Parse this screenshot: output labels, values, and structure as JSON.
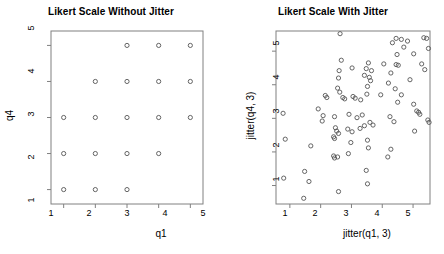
{
  "figure": {
    "width": 444,
    "height": 254,
    "background": "#ffffff",
    "foreground": "#000000",
    "point_stroke": "#555555",
    "axis_stroke": "#808080"
  },
  "panels": [
    {
      "id": "without-jitter",
      "title": "Likert Scale Without Jitter",
      "xlabel": "q1",
      "ylabel": "q4",
      "xticks": [
        "1",
        "2",
        "3",
        "4",
        "5"
      ],
      "yticks": [
        "1",
        "2",
        "3",
        "4",
        "5"
      ]
    },
    {
      "id": "with-jitter",
      "title": "Likert Scale With Jitter",
      "xlabel": "jitter(q1, 3)",
      "ylabel": "jitter(q4, 3)",
      "xticks": [
        "1",
        "2",
        "3",
        "4",
        "5"
      ],
      "yticks": [
        "1",
        "2",
        "3",
        "4",
        "5"
      ]
    }
  ],
  "chart_data": [
    {
      "type": "scatter",
      "title": "Likert Scale Without Jitter",
      "xlabel": "q1",
      "ylabel": "q4",
      "xlim": [
        0.6,
        5.4
      ],
      "ylim": [
        0.6,
        5.4
      ],
      "xticks": [
        1,
        2,
        3,
        4,
        5
      ],
      "yticks": [
        1,
        2,
        3,
        4,
        5
      ],
      "grid": false,
      "legend": null,
      "marker": "open-circle",
      "points": [
        {
          "x": 3,
          "y": 5
        },
        {
          "x": 4,
          "y": 5
        },
        {
          "x": 5,
          "y": 5
        },
        {
          "x": 2,
          "y": 4
        },
        {
          "x": 3,
          "y": 4
        },
        {
          "x": 4,
          "y": 4
        },
        {
          "x": 5,
          "y": 4
        },
        {
          "x": 1,
          "y": 3
        },
        {
          "x": 2,
          "y": 3
        },
        {
          "x": 3,
          "y": 3
        },
        {
          "x": 4,
          "y": 3
        },
        {
          "x": 5,
          "y": 3
        },
        {
          "x": 1,
          "y": 2
        },
        {
          "x": 2,
          "y": 2
        },
        {
          "x": 3,
          "y": 2
        },
        {
          "x": 4,
          "y": 2
        },
        {
          "x": 1,
          "y": 1
        },
        {
          "x": 2,
          "y": 1
        },
        {
          "x": 3,
          "y": 1
        }
      ]
    },
    {
      "type": "scatter",
      "title": "Likert Scale With Jitter",
      "xlabel": "jitter(q1, 3)",
      "ylabel": "jitter(q4, 3)",
      "xlim": [
        0.55,
        5.55
      ],
      "ylim": [
        0.45,
        5.6
      ],
      "xticks": [
        1,
        2,
        3,
        4,
        5
      ],
      "yticks": [
        1,
        2,
        3,
        4,
        5
      ],
      "grid": false,
      "legend": null,
      "marker": "open-circle",
      "points": [
        {
          "x": 2.63,
          "y": 5.52
        },
        {
          "x": 4.33,
          "y": 5.25
        },
        {
          "x": 4.62,
          "y": 5.35
        },
        {
          "x": 4.82,
          "y": 5.3
        },
        {
          "x": 4.45,
          "y": 5.38
        },
        {
          "x": 5.35,
          "y": 5.4
        },
        {
          "x": 5.44,
          "y": 5.38
        },
        {
          "x": 5.5,
          "y": 5.08
        },
        {
          "x": 4.7,
          "y": 5.12
        },
        {
          "x": 5.02,
          "y": 4.92
        },
        {
          "x": 4.48,
          "y": 4.9
        },
        {
          "x": 2.67,
          "y": 4.73
        },
        {
          "x": 3.55,
          "y": 4.65
        },
        {
          "x": 4.05,
          "y": 4.62
        },
        {
          "x": 4.45,
          "y": 4.6
        },
        {
          "x": 4.52,
          "y": 4.58
        },
        {
          "x": 5.28,
          "y": 4.62
        },
        {
          "x": 5.38,
          "y": 4.45
        },
        {
          "x": 2.6,
          "y": 4.42
        },
        {
          "x": 3.02,
          "y": 4.5
        },
        {
          "x": 3.48,
          "y": 4.48
        },
        {
          "x": 3.65,
          "y": 4.42
        },
        {
          "x": 4.28,
          "y": 4.35
        },
        {
          "x": 2.58,
          "y": 4.2
        },
        {
          "x": 3.42,
          "y": 4.28
        },
        {
          "x": 3.58,
          "y": 4.22
        },
        {
          "x": 3.62,
          "y": 4.12
        },
        {
          "x": 4.2,
          "y": 4.05
        },
        {
          "x": 4.9,
          "y": 4.15
        },
        {
          "x": 2.55,
          "y": 3.9
        },
        {
          "x": 3.52,
          "y": 3.95
        },
        {
          "x": 4.42,
          "y": 3.88
        },
        {
          "x": 2.62,
          "y": 3.78
        },
        {
          "x": 3.5,
          "y": 3.72
        },
        {
          "x": 3.95,
          "y": 3.7
        },
        {
          "x": 4.62,
          "y": 3.7
        },
        {
          "x": 2.15,
          "y": 3.68
        },
        {
          "x": 2.2,
          "y": 3.62
        },
        {
          "x": 2.72,
          "y": 3.62
        },
        {
          "x": 2.78,
          "y": 3.58
        },
        {
          "x": 3.05,
          "y": 3.65
        },
        {
          "x": 3.12,
          "y": 3.6
        },
        {
          "x": 3.3,
          "y": 3.55
        },
        {
          "x": 4.5,
          "y": 3.48
        },
        {
          "x": 5.02,
          "y": 3.42
        },
        {
          "x": 0.78,
          "y": 3.15
        },
        {
          "x": 1.92,
          "y": 3.28
        },
        {
          "x": 2.08,
          "y": 3.08
        },
        {
          "x": 2.45,
          "y": 3.05
        },
        {
          "x": 2.92,
          "y": 3.12
        },
        {
          "x": 3.18,
          "y": 3.02
        },
        {
          "x": 3.35,
          "y": 3.1
        },
        {
          "x": 4.25,
          "y": 3.05
        },
        {
          "x": 5.12,
          "y": 3.22
        },
        {
          "x": 5.18,
          "y": 3.18
        },
        {
          "x": 5.22,
          "y": 3.12
        },
        {
          "x": 5.48,
          "y": 2.95
        },
        {
          "x": 5.52,
          "y": 2.88
        },
        {
          "x": 2.05,
          "y": 2.92
        },
        {
          "x": 3.6,
          "y": 2.88
        },
        {
          "x": 4.38,
          "y": 2.9
        },
        {
          "x": 2.48,
          "y": 2.72
        },
        {
          "x": 2.52,
          "y": 2.62
        },
        {
          "x": 2.58,
          "y": 2.55
        },
        {
          "x": 2.88,
          "y": 2.68
        },
        {
          "x": 3.02,
          "y": 2.6
        },
        {
          "x": 3.28,
          "y": 2.7
        },
        {
          "x": 3.42,
          "y": 2.78
        },
        {
          "x": 3.7,
          "y": 2.8
        },
        {
          "x": 5.05,
          "y": 2.62
        },
        {
          "x": 2.42,
          "y": 2.45
        },
        {
          "x": 2.45,
          "y": 2.4
        },
        {
          "x": 2.98,
          "y": 2.28
        },
        {
          "x": 3.52,
          "y": 2.35
        },
        {
          "x": 0.85,
          "y": 2.38
        },
        {
          "x": 1.68,
          "y": 2.18
        },
        {
          "x": 3.55,
          "y": 2.12
        },
        {
          "x": 4.28,
          "y": 2.08
        },
        {
          "x": 2.42,
          "y": 1.88
        },
        {
          "x": 2.45,
          "y": 1.82
        },
        {
          "x": 2.55,
          "y": 1.85
        },
        {
          "x": 2.9,
          "y": 1.95
        },
        {
          "x": 4.18,
          "y": 1.85
        },
        {
          "x": 1.48,
          "y": 1.42
        },
        {
          "x": 3.48,
          "y": 1.45
        },
        {
          "x": 0.8,
          "y": 1.22
        },
        {
          "x": 1.62,
          "y": 1.12
        },
        {
          "x": 2.58,
          "y": 0.82
        },
        {
          "x": 3.52,
          "y": 1.05
        },
        {
          "x": 1.45,
          "y": 0.62
        }
      ]
    }
  ]
}
